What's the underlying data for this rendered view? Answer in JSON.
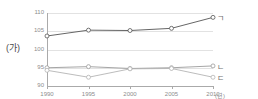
{
  "figure": {
    "panel_label": "(가)",
    "title": "",
    "x_unit": "(년)"
  },
  "chart_data": {
    "type": "line",
    "title": "",
    "xlabel": "(년)",
    "ylabel": "",
    "x": [
      1990,
      1995,
      2000,
      2005,
      2010
    ],
    "categories": [
      "1990",
      "1995",
      "2000",
      "2005",
      "2010"
    ],
    "ylim": [
      90,
      110
    ],
    "yticks": [
      90,
      95,
      100,
      105,
      110
    ],
    "ytick_labels": [
      "90",
      "95",
      "100",
      "105",
      "110"
    ],
    "grid": true,
    "legend_position": "right-inline",
    "series": [
      {
        "name": "ㄱ",
        "values": [
          103.7,
          105.3,
          105.2,
          105.8,
          108.8
        ],
        "color": "#555555"
      },
      {
        "name": "ㄴ",
        "values": [
          95.0,
          95.3,
          94.8,
          95.0,
          95.5
        ],
        "color": "#9b9b9b"
      },
      {
        "name": "ㄷ",
        "values": [
          94.3,
          92.4,
          94.7,
          94.8,
          92.4
        ],
        "color": "#b4b4b4"
      }
    ]
  },
  "colors": {
    "axis": "#aaaaaa",
    "grid": "#e2e2e2",
    "tick_text": "#8d8d8d",
    "label_text": "#4a4a4a",
    "marker_fill": "#ffffff"
  }
}
